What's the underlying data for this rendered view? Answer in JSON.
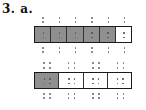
{
  "problem": {
    "label": "3. a."
  },
  "figures": [
    {
      "name": "bar-sixths",
      "parts": 6,
      "shaded": 5,
      "shade_color": "#8f8f8f",
      "dot_pattern": "1x2"
    },
    {
      "name": "bar-fourths",
      "parts": 4,
      "shaded": 1,
      "shade_color": "#8f8f8f",
      "dot_pattern": "2x2"
    }
  ]
}
